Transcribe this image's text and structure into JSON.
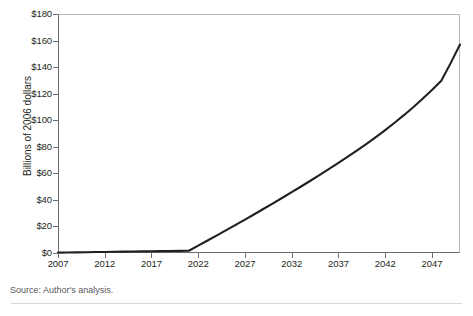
{
  "figure": {
    "source_note": "Source: Author's analysis."
  },
  "chart_data": {
    "type": "line",
    "title": "",
    "xlabel": "",
    "ylabel": "Billions of 2006 dollars",
    "xlim": [
      2007,
      2050
    ],
    "ylim": [
      0,
      180
    ],
    "grid": false,
    "legend": false,
    "y_ticks": [
      0,
      20,
      40,
      60,
      80,
      100,
      120,
      140,
      160,
      180
    ],
    "y_tick_labels": [
      "$0",
      "$20",
      "$40",
      "$60",
      "$80",
      "$100",
      "$120",
      "$140",
      "$160",
      "$180"
    ],
    "x_ticks": [
      2007,
      2012,
      2017,
      2022,
      2027,
      2032,
      2037,
      2042,
      2047
    ],
    "x_tick_labels": [
      "2007",
      "2012",
      "2017",
      "2022",
      "2027",
      "2032",
      "2037",
      "2042",
      "2047"
    ],
    "series": [
      {
        "name": "Projected cost",
        "color": "#231f20",
        "x": [
          2007,
          2008,
          2009,
          2010,
          2011,
          2012,
          2013,
          2014,
          2015,
          2016,
          2017,
          2018,
          2019,
          2020,
          2021,
          2022,
          2023,
          2024,
          2025,
          2026,
          2027,
          2028,
          2029,
          2030,
          2031,
          2032,
          2033,
          2034,
          2035,
          2036,
          2037,
          2038,
          2039,
          2040,
          2041,
          2042,
          2043,
          2044,
          2045,
          2046,
          2047,
          2048,
          2049,
          2050
        ],
        "values": [
          0.3,
          0.4,
          0.5,
          0.6,
          0.7,
          0.8,
          0.9,
          1.0,
          1.1,
          1.2,
          1.3,
          1.4,
          1.5,
          1.6,
          1.7,
          5.5,
          9.4,
          13.3,
          17.2,
          21.2,
          25.2,
          29.2,
          33.3,
          37.4,
          41.6,
          45.8,
          50.1,
          54.4,
          58.8,
          63.3,
          67.8,
          72.5,
          77.3,
          82.2,
          87.3,
          92.6,
          98.1,
          103.8,
          109.8,
          116.1,
          122.7,
          129.7,
          143.0,
          157.0
        ]
      }
    ]
  }
}
